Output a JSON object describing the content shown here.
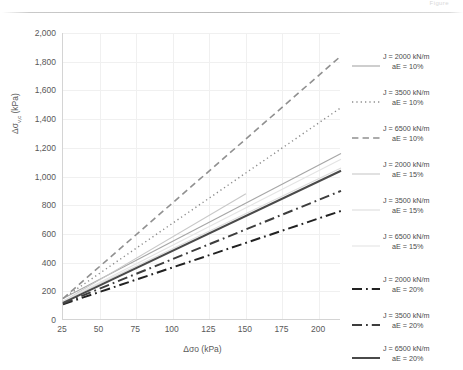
{
  "header": {
    "faint_text": "Figure"
  },
  "chart_data": {
    "type": "line",
    "title": "",
    "xlabel": "Δσο (kPa)",
    "ylabel": "Δσv,c (kPa)",
    "ylabel_main": "Δσ",
    "ylabel_sub": "v,c",
    "ylabel_unit": " (kPa)",
    "xlim": [
      25,
      215
    ],
    "ylim": [
      0,
      2000
    ],
    "x_ticks": [
      "25",
      "50",
      "75",
      "100",
      "125",
      "150",
      "175",
      "200"
    ],
    "x_tick_values": [
      25,
      50,
      75,
      100,
      125,
      150,
      175,
      200
    ],
    "y_ticks": [
      "0",
      "200",
      "400",
      "600",
      "800",
      "1,000",
      "1,200",
      "1,400",
      "1,600",
      "1,800",
      "2,000"
    ],
    "y_tick_values": [
      0,
      200,
      400,
      600,
      800,
      1000,
      1200,
      1400,
      1600,
      1800,
      2000
    ],
    "grid": true,
    "legend_position": "right",
    "series": [
      {
        "name": "J = 2000 kN/m aE = 10%",
        "label_line1": "J = 2000 kN/m",
        "label_line2": "aE = 10%",
        "style": "solid",
        "color": "#a6a6a6",
        "width": 1.1,
        "x": [
          25,
          215
        ],
        "y": [
          150,
          1160
        ]
      },
      {
        "name": "J = 3500 kN/m aE = 10%",
        "label_line1": "J = 3500 kN/m",
        "label_line2": "aE = 10%",
        "style": "dotted",
        "color": "#8c8c8c",
        "width": 1.4,
        "x": [
          25,
          215
        ],
        "y": [
          150,
          1480
        ]
      },
      {
        "name": "J = 6500 kN/m aE = 10%",
        "label_line1": "J = 6500 kN/m",
        "label_line2": "aE = 10%",
        "style": "dashed",
        "color": "#909090",
        "width": 1.6,
        "x": [
          25,
          215
        ],
        "y": [
          150,
          1840
        ]
      },
      {
        "name": "J = 2000 kN/m aE = 15%",
        "label_line1": "J = 2000 kN/m",
        "label_line2": "aE = 15%",
        "style": "solid",
        "color": "#c8c8c8",
        "width": 1.1,
        "x": [
          25,
          150
        ],
        "y": [
          130,
          880
        ]
      },
      {
        "name": "J = 3500 kN/m aE = 15%",
        "label_line1": "J = 3500 kN/m",
        "label_line2": "aE = 15%",
        "style": "solid",
        "color": "#dcdcdc",
        "width": 1.1,
        "x": [
          25,
          215
        ],
        "y": [
          130,
          1060
        ]
      },
      {
        "name": "J = 6500 kN/m aE = 15%",
        "label_line1": "J = 6500 kN/m",
        "label_line2": "aE = 15%",
        "style": "solid",
        "color": "#e4e4e4",
        "width": 1.1,
        "x": [
          25,
          215
        ],
        "y": [
          130,
          1120
        ]
      },
      {
        "name": "J = 2000 kN/m aE = 20%",
        "label_line1": "J = 2000 kN/m",
        "label_line2": "aE = 20%",
        "style": "dashdot",
        "color": "#222222",
        "width": 2.0,
        "x": [
          25,
          215
        ],
        "y": [
          110,
          760
        ]
      },
      {
        "name": "J = 3500 kN/m aE = 20%",
        "label_line1": "J = 3500 kN/m",
        "label_line2": "aE = 20%",
        "style": "dashdot",
        "color": "#3d3d3d",
        "width": 2.0,
        "x": [
          25,
          215
        ],
        "y": [
          115,
          900
        ]
      },
      {
        "name": "J = 6500 kN/m aE = 20%",
        "label_line1": "J = 6500 kN/m",
        "label_line2": "aE = 20%",
        "style": "solid",
        "color": "#4a4a4a",
        "width": 2.0,
        "x": [
          25,
          215
        ],
        "y": [
          120,
          1040
        ]
      }
    ]
  }
}
